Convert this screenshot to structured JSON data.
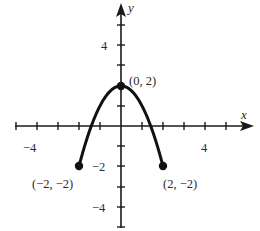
{
  "chart_data": {
    "type": "line",
    "title": "",
    "xlabel": "x",
    "ylabel": "y",
    "xlim": [
      -5.2,
      6.2
    ],
    "ylim": [
      -5.2,
      6.0
    ],
    "grid": false,
    "legend": null,
    "x_tick_labels": [
      {
        "value": -4,
        "label": "−4"
      },
      {
        "value": 4,
        "label": "4"
      }
    ],
    "y_tick_labels": [
      {
        "value": 4,
        "label": "4"
      },
      {
        "value": -2,
        "label": "−2"
      },
      {
        "value": -4,
        "label": "−4"
      }
    ],
    "x_ticks": [
      -5,
      -4,
      -3,
      -2,
      -1,
      1,
      2,
      3,
      4,
      5
    ],
    "y_ticks": [
      -5,
      -4,
      -3,
      -2,
      -1,
      1,
      2,
      3,
      4,
      5
    ],
    "series": [
      {
        "name": "y = 2 - x^2",
        "x": [
          -2,
          -1.5,
          -1,
          -0.5,
          0,
          0.5,
          1,
          1.5,
          2
        ],
        "y": [
          -2,
          -0.25,
          1,
          1.75,
          2,
          1.75,
          1,
          -0.25,
          -2
        ]
      }
    ],
    "points": [
      {
        "x": -2,
        "y": -2,
        "label": "(−2, −2)"
      },
      {
        "x": 0,
        "y": 2,
        "label": "(0, 2)"
      },
      {
        "x": 2,
        "y": -2,
        "label": "(2, −2)"
      }
    ]
  },
  "labels": {
    "x_axis": "x",
    "y_axis": "y",
    "x_neg4": "−4",
    "x_pos4": "4",
    "y_pos4": "4",
    "y_neg2": "−2",
    "y_neg4": "−4",
    "pt_left": "(−2, −2)",
    "pt_top": "(0, 2)",
    "pt_right": "(2, −2)"
  }
}
